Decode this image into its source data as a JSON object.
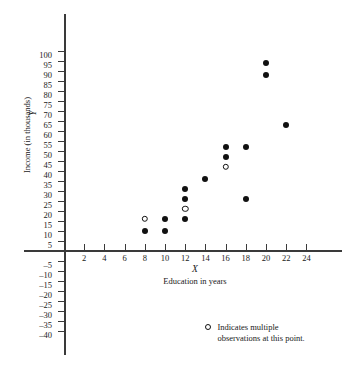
{
  "chart_data": {
    "type": "scatter",
    "title": "",
    "xlabel": "Education in years",
    "ylabel": "Income (in thousands)",
    "x_variable": "X",
    "y_variable": "Y",
    "xlim": [
      0,
      25
    ],
    "ylim": [
      -40,
      100
    ],
    "grid": false,
    "x_ticks": [
      2,
      4,
      6,
      8,
      10,
      12,
      14,
      16,
      18,
      20,
      22,
      24
    ],
    "y_ticks": [
      100,
      95,
      90,
      85,
      80,
      75,
      70,
      65,
      60,
      55,
      50,
      45,
      40,
      35,
      30,
      25,
      20,
      15,
      10,
      5,
      -5,
      -10,
      -15,
      -20,
      -25,
      -30,
      -35,
      -40
    ],
    "x_tick_labels": [
      "2",
      "4",
      "6",
      "8",
      "10",
      "12",
      "14",
      "16",
      "18",
      "20",
      "22",
      "24"
    ],
    "y_tick_labels": [
      "100",
      "95",
      "90",
      "85",
      "80",
      "75",
      "70",
      "65",
      "60",
      "55",
      "50",
      "45",
      "40",
      "35",
      "30",
      "25",
      "20",
      "15",
      "10",
      "5",
      "–5",
      "–10",
      "–15",
      "–20",
      "–25",
      "–30",
      "–35",
      "–40"
    ],
    "marker_colors": {
      "filled": "#111111",
      "open_fill": "#ffffff",
      "open_stroke": "#111111"
    },
    "points": [
      {
        "x": 8,
        "y": 16,
        "marker": "open",
        "note": "multiple observations"
      },
      {
        "x": 8,
        "y": 10,
        "marker": "filled",
        "note": ""
      },
      {
        "x": 10,
        "y": 16,
        "marker": "filled",
        "note": ""
      },
      {
        "x": 10,
        "y": 10,
        "marker": "filled",
        "note": ""
      },
      {
        "x": 12,
        "y": 31,
        "marker": "filled",
        "note": ""
      },
      {
        "x": 12,
        "y": 26,
        "marker": "filled",
        "note": ""
      },
      {
        "x": 12,
        "y": 21,
        "marker": "open",
        "note": "multiple observations"
      },
      {
        "x": 12,
        "y": 16,
        "marker": "filled",
        "note": ""
      },
      {
        "x": 14,
        "y": 36,
        "marker": "filled",
        "note": ""
      },
      {
        "x": 16,
        "y": 52,
        "marker": "filled",
        "note": ""
      },
      {
        "x": 16,
        "y": 47,
        "marker": "filled",
        "note": ""
      },
      {
        "x": 16,
        "y": 42,
        "marker": "open",
        "note": "multiple observations"
      },
      {
        "x": 18,
        "y": 52,
        "marker": "filled",
        "note": ""
      },
      {
        "x": 18,
        "y": 26,
        "marker": "filled",
        "note": ""
      },
      {
        "x": 20,
        "y": 94,
        "marker": "filled",
        "note": ""
      },
      {
        "x": 20,
        "y": 88,
        "marker": "filled",
        "note": ""
      },
      {
        "x": 22,
        "y": 63,
        "marker": "filled",
        "note": ""
      }
    ],
    "legend": {
      "position": "bottom-right",
      "marker": "open",
      "line1": "Indicates multiple",
      "line2": "observations at this point."
    }
  }
}
